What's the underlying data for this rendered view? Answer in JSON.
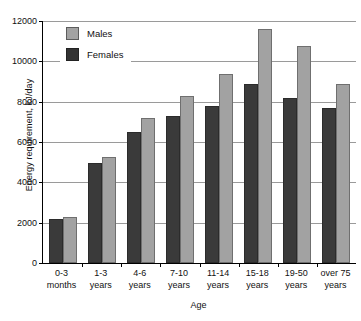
{
  "chart_data": {
    "type": "bar",
    "title": "",
    "xlabel": "Age",
    "ylabel": "Energy requirement, kJ/day",
    "categories": [
      "0-3 months",
      "1-3 years",
      "4-6 years",
      "7-10 years",
      "11-14 years",
      "15-18 years",
      "19-50 years",
      "over 75 years"
    ],
    "category_lines": [
      {
        "line1": "0-3",
        "line2": "months"
      },
      {
        "line1": "1-3",
        "line2": "years"
      },
      {
        "line1": "4-6",
        "line2": "years"
      },
      {
        "line1": "7-10",
        "line2": "years"
      },
      {
        "line1": "11-14",
        "line2": "years"
      },
      {
        "line1": "15-18",
        "line2": "years"
      },
      {
        "line1": "19-50",
        "line2": "years"
      },
      {
        "line1": "over 75",
        "line2": "years"
      }
    ],
    "series": [
      {
        "name": "Females",
        "color": "#3a3a3a",
        "values": [
          2200,
          4950,
          6500,
          7300,
          7800,
          8900,
          8200,
          7700
        ]
      },
      {
        "name": "Males",
        "color": "#a2a2a2",
        "values": [
          2300,
          5250,
          7200,
          8300,
          9350,
          11600,
          10750,
          8900
        ]
      }
    ],
    "series_order_in_group": [
      "Females",
      "Males"
    ],
    "ylim": [
      0,
      12000
    ],
    "yticks": [
      0,
      2000,
      4000,
      6000,
      8000,
      10000,
      12000
    ],
    "ytick_labels": [
      "0",
      "2000",
      "4000",
      "6000",
      "8000",
      "10000",
      "12000"
    ],
    "grid": true,
    "legend_position": "top-left",
    "legend": [
      {
        "label": "Males",
        "color": "#a2a2a2"
      },
      {
        "label": "Females",
        "color": "#333333"
      }
    ]
  }
}
